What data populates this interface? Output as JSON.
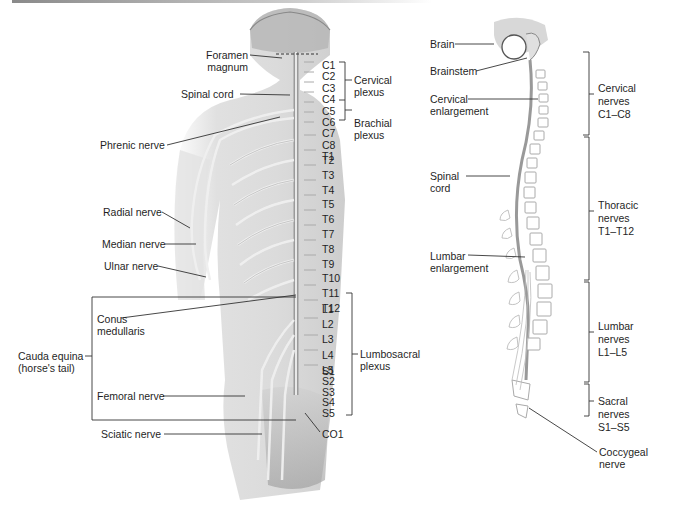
{
  "figure": {
    "left_panel": {
      "labels": {
        "foramen_magnum_1": "Foramen",
        "foramen_magnum_2": "magnum",
        "spinal_cord": "Spinal cord",
        "phrenic_nerve": "Phrenic nerve",
        "radial_nerve": "Radial nerve",
        "median_nerve": "Median nerve",
        "ulnar_nerve": "Ulnar nerve",
        "conus_1": "Conus",
        "conus_2": "medullaris",
        "cauda_1": "Cauda equina",
        "cauda_2": "(horse's tail)",
        "femoral_nerve": "Femoral nerve",
        "sciatic_nerve": "Sciatic nerve",
        "co1": "CO1"
      },
      "segments": {
        "cervical": [
          "C1",
          "C2",
          "C3",
          "C4",
          "C5",
          "C6",
          "C7",
          "C8"
        ],
        "thoracic": [
          "T1",
          "T2",
          "T3",
          "T4",
          "T5",
          "T6",
          "T7",
          "T8",
          "T9",
          "T10",
          "T11",
          "T12"
        ],
        "lumbar": [
          "L1",
          "L2",
          "L3",
          "L4",
          "L5"
        ],
        "sacral": [
          "S1",
          "S2",
          "S3",
          "S4",
          "S5"
        ]
      },
      "plexuses": {
        "cervical_1": "Cervical",
        "cervical_2": "plexus",
        "brachial_1": "Brachial",
        "brachial_2": "plexus",
        "lumbosacral_1": "Lumbosacral",
        "lumbosacral_2": "plexus"
      }
    },
    "right_panel": {
      "labels": {
        "brain": "Brain",
        "brainstem": "Brainstem",
        "cervical_enl_1": "Cervical",
        "cervical_enl_2": "enlargement",
        "spinal_cord_1": "Spinal",
        "spinal_cord_2": "cord",
        "lumbar_enl_1": "Lumbar",
        "lumbar_enl_2": "enlargement",
        "coccygeal_1": "Coccygeal",
        "coccygeal_2": "nerve"
      },
      "nerve_groups": [
        {
          "line1": "Cervical",
          "line2": "nerves",
          "line3": "C1–C8"
        },
        {
          "line1": "Thoracic",
          "line2": "nerves",
          "line3": "T1–T12"
        },
        {
          "line1": "Lumbar",
          "line2": "nerves",
          "line3": "L1–L5"
        },
        {
          "line1": "Sacral",
          "line2": "nerves",
          "line3": "S1–S5"
        }
      ]
    },
    "colors": {
      "text": "#1f1f1f",
      "leader_line": "#333333",
      "body_shading": "#c9c9c9",
      "nerve": "#f2f2f2",
      "background": "#ffffff"
    }
  }
}
